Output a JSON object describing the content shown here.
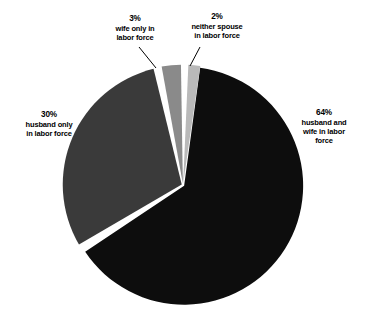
{
  "chart_data": {
    "type": "pie",
    "title": "",
    "subtitle": "",
    "xlabel": "",
    "ylabel": "",
    "legend_position": "none",
    "grid": false,
    "unit": "percent",
    "total": 99,
    "categories": [
      "husband and wife in labor force",
      "husband only in labor force",
      "wife only in labor force",
      "neither spouse in labor force"
    ],
    "values": [
      64,
      30,
      3,
      2
    ],
    "slices": [
      {
        "key": "husband-and-wife",
        "percent": 64,
        "percent_text": "64%",
        "label_lines": [
          "husband and",
          "wife in labor",
          "force"
        ],
        "color": "#0d0d0d",
        "start_angle_deg": 7,
        "end_angle_deg": 237,
        "has_leader_line": false
      },
      {
        "key": "husband-only",
        "percent": 30,
        "percent_text": "30%",
        "label_lines": [
          "husband only",
          "in labor force"
        ],
        "color": "#3a3a3a",
        "start_angle_deg": 239,
        "end_angle_deg": 347,
        "has_leader_line": false
      },
      {
        "key": "wife-only",
        "percent": 3,
        "percent_text": "3%",
        "label_lines": [
          "wife only in",
          "labor force"
        ],
        "color": "#8a8a8a",
        "start_angle_deg": 349,
        "end_angle_deg": 359.8,
        "has_leader_line": true
      },
      {
        "key": "neither-spouse",
        "percent": 2,
        "percent_text": "2%",
        "label_lines": [
          "neither spouse",
          "in labor force"
        ],
        "color": "#b9b9b9",
        "start_angle_deg": 1.8,
        "end_angle_deg": 9,
        "has_leader_line": true
      }
    ],
    "geometry": {
      "center_x": 183,
      "center_y": 185,
      "radius": 119,
      "separator_color": "#ffffff",
      "separator_width": 3,
      "background": "#ffffff"
    }
  },
  "labels": {
    "wife_only": {
      "percent_text": "3%",
      "line1": "wife only in",
      "line2": "labor force"
    },
    "neither_spouse": {
      "percent_text": "2%",
      "line1": "neither spouse",
      "line2": "in labor force"
    },
    "husband_only": {
      "percent_text": "30%",
      "line1": "husband only",
      "line2": "in labor force"
    },
    "husband_and_wife": {
      "percent_text": "64%",
      "line1": "husband and",
      "line2": "wife in labor",
      "line3": "force"
    }
  }
}
